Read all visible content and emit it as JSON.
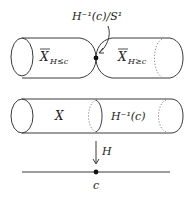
{
  "diagram": {
    "top_figure": {
      "point_label": "H⁻¹(c)/S¹",
      "left_region": {
        "main": "X",
        "sub": "H≤c"
      },
      "right_region": {
        "main": "X",
        "sub": "H≥c"
      }
    },
    "middle_figure": {
      "left_label": "X",
      "right_label": "H⁻¹(c)"
    },
    "map": {
      "arrow_label": "H"
    },
    "base_line": {
      "point_label": "c"
    },
    "colors": {
      "stroke": "#3a3a3a",
      "dotted": "#888888",
      "text": "#222222",
      "background": "#ffffff"
    }
  }
}
